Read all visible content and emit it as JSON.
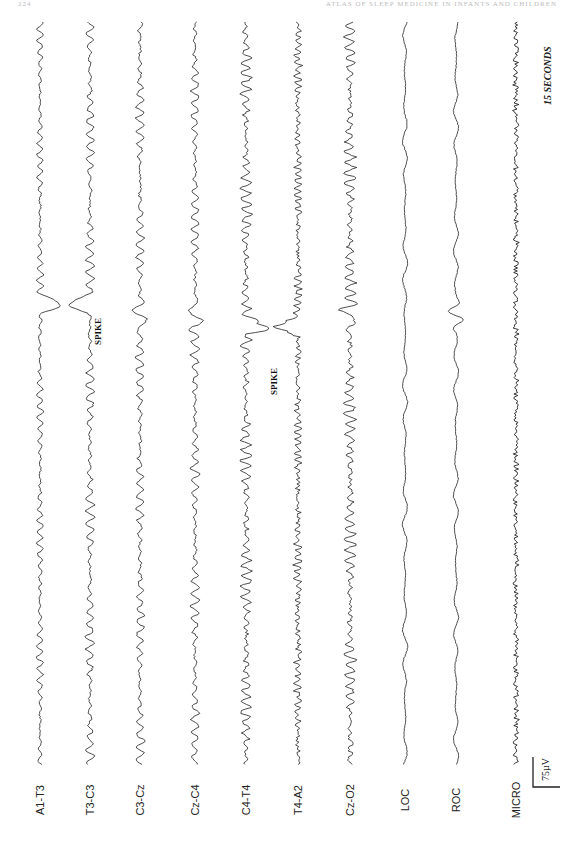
{
  "header": {
    "page_number": "224",
    "running_head": "ATLAS OF SLEEP MEDICINE IN INFANTS AND CHILDREN"
  },
  "figure": {
    "orientation": "rotated 90° (time runs top-to-bottom)",
    "time_scale_label": "15 SECONDS",
    "amplitude_scale_label": "75µV",
    "annotations": [
      {
        "label": "SPIKE",
        "channels": [
          "A1-T3",
          "T3-C3"
        ],
        "time_fraction": 0.38
      },
      {
        "label": "SPIKE",
        "channels": [
          "C4-T4",
          "T4-A2"
        ],
        "time_fraction": 0.41
      }
    ],
    "channels": [
      {
        "label": "A1-T3",
        "activity": "low-mid"
      },
      {
        "label": "T3-C3",
        "activity": "mid"
      },
      {
        "label": "C3-Cz",
        "activity": "mid"
      },
      {
        "label": "Cz-C4",
        "activity": "mid"
      },
      {
        "label": "C4-T4",
        "activity": "high"
      },
      {
        "label": "T4-A2",
        "activity": "high-fast"
      },
      {
        "label": "Cz-O2",
        "activity": "high"
      },
      {
        "label": "LOC",
        "activity": "slow"
      },
      {
        "label": "ROC",
        "activity": "slow"
      },
      {
        "label": "MICRO",
        "activity": "muscle"
      }
    ]
  }
}
